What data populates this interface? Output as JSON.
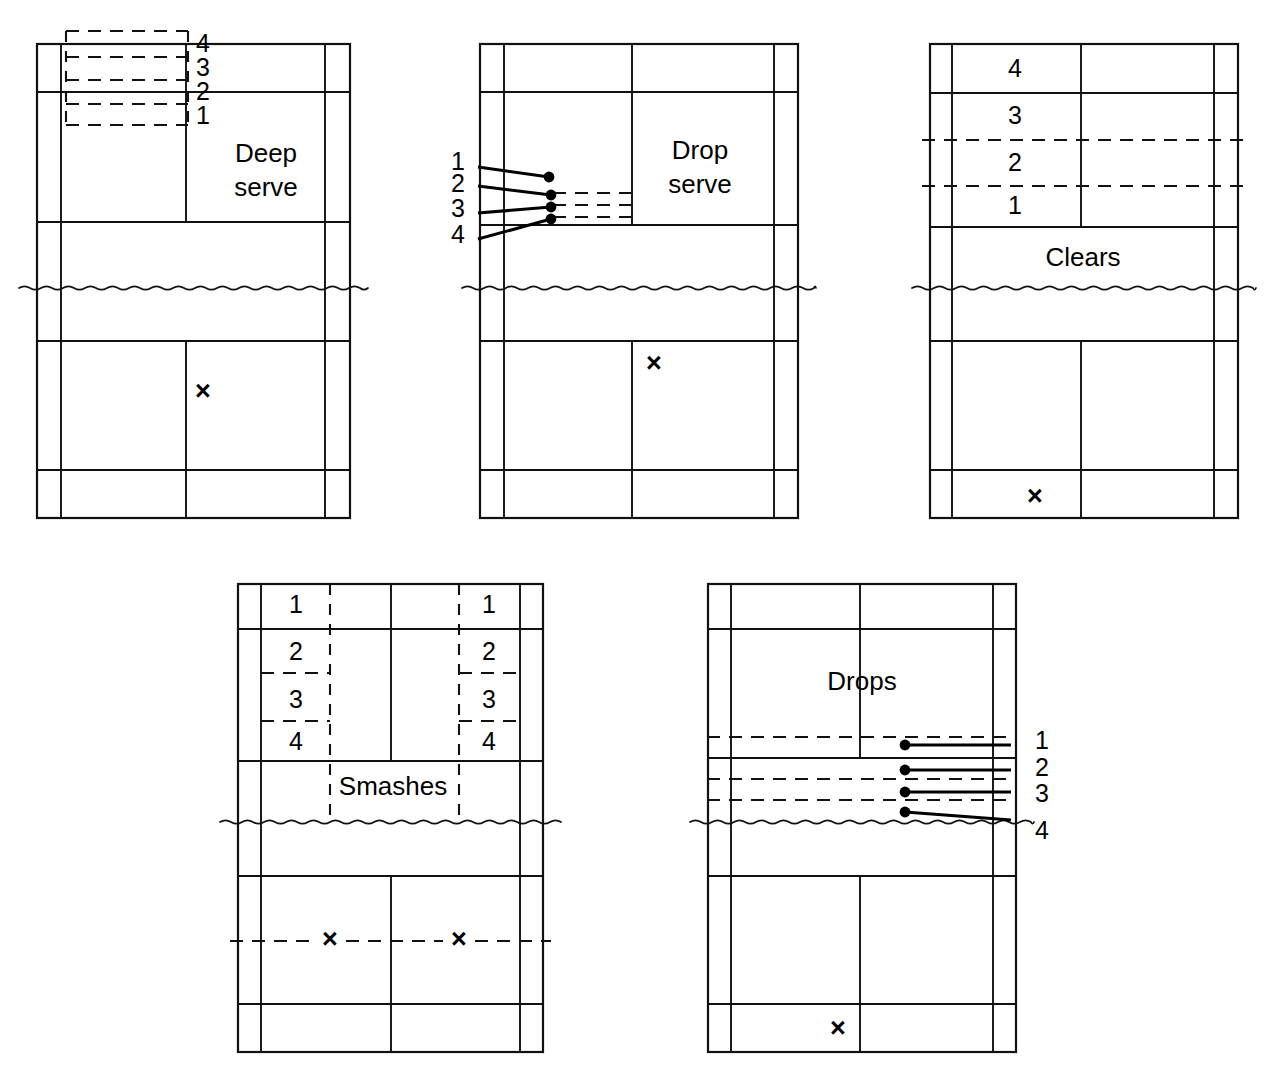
{
  "figure": {
    "background_color": "#ffffff",
    "line_color": "#111111",
    "marker_color": "#000000",
    "x_mark_glyph": "×"
  },
  "courts": [
    {
      "id": "deep-serve",
      "title": "Deep serve",
      "title_lines": [
        "Deep",
        "serve"
      ],
      "title_position": "right-upper",
      "zone_labels": [
        "4",
        "3",
        "2",
        "1"
      ],
      "zone_label_side": "right-of-centre",
      "zone_style": "horizontal-bands-rear-left",
      "player_mark": "×",
      "player_mark_position": "near-centre-right",
      "has_trajectories": false,
      "geometry": {
        "left": 37,
        "right": 350,
        "top": 44,
        "bottom": 518,
        "alley_left": 61,
        "alley_right": 325,
        "singles_left": 61,
        "singles_right": 325,
        "centre_x": 186,
        "rear_service_line": 92,
        "short_service_line_top": 222,
        "net_y": 288,
        "short_service_line_bottom": 341,
        "long_service_line_bottom": 470,
        "band_lines": [
          31,
          57,
          80,
          104,
          125
        ],
        "band_left": 66,
        "band_right": 188,
        "label_x": 196,
        "label_ys": [
          45,
          69,
          93,
          117
        ],
        "title_x": 266,
        "title_y_start": 155,
        "title_line_gap": 34,
        "mark_x": 203,
        "mark_y": 393
      }
    },
    {
      "id": "drop-serve",
      "title": "Drop serve",
      "title_lines": [
        "Drop",
        "serve"
      ],
      "title_position": "right-upper",
      "zone_labels": [
        "1",
        "2",
        "3",
        "4"
      ],
      "zone_label_side": "left-outside",
      "zone_style": "trajectories-to-front-left",
      "player_mark": "×",
      "player_mark_position": "near-centre-right",
      "has_trajectories": true,
      "trajectories": [
        {
          "label": "1",
          "label_x": 465,
          "label_y": 163,
          "from_x": 478,
          "from_y": 167,
          "to_x": 549,
          "to_y": 177,
          "dot_x": 549,
          "dot_y": 177,
          "dash_y": null
        },
        {
          "label": "2",
          "label_x": 465,
          "label_y": 185,
          "from_x": 478,
          "from_y": 186,
          "to_x": 551,
          "to_y": 195,
          "dot_x": 551,
          "dot_y": 195,
          "dash_y": 193
        },
        {
          "label": "3",
          "label_x": 465,
          "label_y": 210,
          "from_x": 478,
          "from_y": 213,
          "to_x": 551,
          "to_y": 207,
          "dot_x": 551,
          "dot_y": 207,
          "dash_y": 205
        },
        {
          "label": "4",
          "label_x": 465,
          "label_y": 236,
          "from_x": 478,
          "from_y": 239,
          "to_x": 551,
          "to_y": 219,
          "dot_x": 551,
          "dot_y": 219,
          "dash_y": 217
        }
      ],
      "geometry": {
        "left": 480,
        "right": 798,
        "top": 44,
        "bottom": 518,
        "alley_left": 504,
        "alley_right": 774,
        "centre_x": 632,
        "rear_service_line": 92,
        "short_service_line_top": 225,
        "net_y": 288,
        "short_service_line_bottom": 341,
        "long_service_line_bottom": 470,
        "dash_right": 632,
        "title_x": 700,
        "title_y_start": 152,
        "title_line_gap": 34,
        "mark_x": 654,
        "mark_y": 365
      }
    },
    {
      "id": "clears",
      "title": "Clears",
      "title_lines": [
        "Clears"
      ],
      "title_position": "centre-lower",
      "zone_labels": [
        "4",
        "3",
        "2",
        "1"
      ],
      "zone_label_side": "inside-left-half",
      "zone_style": "horizontal-bands-rear",
      "player_mark": "×",
      "player_mark_position": "rear-alley",
      "has_trajectories": false,
      "geometry": {
        "left": 930,
        "right": 1238,
        "top": 44,
        "bottom": 518,
        "alley_left": 952,
        "alley_right": 1214,
        "centre_x": 1081,
        "rear_service_line": 93,
        "short_service_line_top": 227,
        "net_y": 288,
        "short_service_line_bottom": 341,
        "long_service_line_bottom": 470,
        "band_lines": [
          44,
          93,
          140,
          186,
          227
        ],
        "dashed_band_lines": [
          140,
          186
        ],
        "label_x": 1015,
        "label_ys": [
          70,
          117,
          164,
          207
        ],
        "title_x": 1083,
        "title_y_start": 259,
        "title_line_gap": 34,
        "mark_x": 1035,
        "mark_y": 498
      }
    },
    {
      "id": "smashes",
      "title": "Smashes",
      "title_lines": [
        "Smashes"
      ],
      "title_position": "centre-lower",
      "zone_labels_left": [
        "1",
        "2",
        "3",
        "4"
      ],
      "zone_labels_right": [
        "1",
        "2",
        "3",
        "4"
      ],
      "zone_label_side": "both-corridors",
      "zone_style": "vertical-corridors-both-sides",
      "player_marks": [
        "×",
        "×"
      ],
      "has_trajectories": false,
      "geometry": {
        "left": 238,
        "right": 543,
        "top": 584,
        "bottom": 1052,
        "alley_left": 261,
        "alley_right": 520,
        "centre_x": 391,
        "rear_service_line": 629,
        "short_service_line_top": 761,
        "net_y": 822,
        "short_service_line_bottom": 876,
        "long_service_line_bottom": 1004,
        "corridor_left_x": 330,
        "corridor_right_x": 459,
        "corridor_left_inner": 261,
        "corridor_right_inner": 520,
        "corridor_top": 584,
        "corridor_bottom": 822,
        "box_dash_ys": [
          673,
          721
        ],
        "left_box_left": 261,
        "left_box_right": 330,
        "right_box_left": 459,
        "right_box_right": 520,
        "left_label_x": 296,
        "right_label_x": 489,
        "label_ys": [
          606,
          653,
          701,
          743
        ],
        "title_x": 393,
        "title_y_start": 788,
        "title_line_gap": 34,
        "bottom_dash_y": 941,
        "mark1_x": 330,
        "mark1_y": 941,
        "mark2_x": 459,
        "mark2_y": 941
      }
    },
    {
      "id": "drops",
      "title": "Drops",
      "title_lines": [
        "Drops"
      ],
      "title_position": "centre-upper",
      "zone_labels": [
        "1",
        "2",
        "3",
        "4"
      ],
      "zone_label_side": "right-outside",
      "zone_style": "trajectories-to-front-right",
      "player_mark": "×",
      "player_mark_position": "rear-alley",
      "has_trajectories": true,
      "trajectories": [
        {
          "label": "1",
          "label_x": 1035,
          "label_y": 742,
          "from_x": 905,
          "from_y": 745,
          "to_x": 1011,
          "to_y": 745,
          "dot_x": 905,
          "dot_y": 745,
          "dash_y": 737
        },
        {
          "label": "2",
          "label_x": 1035,
          "label_y": 769,
          "from_x": 905,
          "from_y": 770,
          "to_x": 1011,
          "to_y": 770,
          "dot_x": 905,
          "dot_y": 770,
          "dash_y": 779
        },
        {
          "label": "3",
          "label_x": 1035,
          "label_y": 795,
          "from_x": 905,
          "from_y": 792,
          "to_x": 1011,
          "to_y": 792,
          "dot_x": 905,
          "dot_y": 792,
          "dash_y": 800
        },
        {
          "label": "4",
          "label_x": 1035,
          "label_y": 832,
          "from_x": 905,
          "from_y": 812,
          "to_x": 1011,
          "to_y": 820,
          "dot_x": 905,
          "dot_y": 812,
          "dash_y": null
        }
      ],
      "geometry": {
        "left": 708,
        "right": 1016,
        "top": 584,
        "bottom": 1052,
        "alley_left": 731,
        "alley_right": 993,
        "centre_x": 860,
        "rear_service_line": 629,
        "front_solid_line": 758,
        "short_service_line_top": 758,
        "net_y": 822,
        "short_service_line_bottom": 876,
        "long_service_line_bottom": 1004,
        "dash_left": 731,
        "dash_right": 1011,
        "dashed_lines": [
          737,
          779,
          800
        ],
        "title_x": 862,
        "title_y_start": 683,
        "title_line_gap": 34,
        "mark_x": 838,
        "mark_y": 1030
      }
    }
  ]
}
